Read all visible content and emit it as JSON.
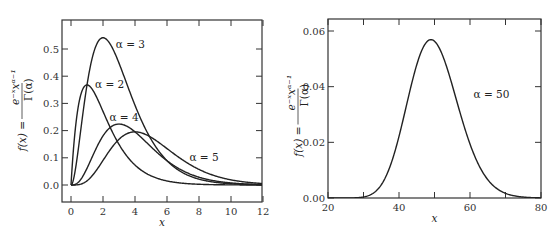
{
  "chart_data": [
    {
      "type": "line",
      "title": "",
      "xlabel": "x",
      "ylabel": "f(x) = e^{-x} x^{α-1} / Γ(α)",
      "ylabel_parts": {
        "lhs": "f(x) =",
        "num": "e^{-x} x^{α-1}",
        "den": "Γ(α)"
      },
      "xlim": [
        -0.5,
        12
      ],
      "ylim": [
        -0.06,
        0.6
      ],
      "xticks": [
        0,
        2,
        4,
        6,
        8,
        10,
        12
      ],
      "xtick_labels": [
        "0",
        "2",
        "4",
        "6",
        "8",
        "10",
        "12"
      ],
      "yticks": [
        0.0,
        0.1,
        0.2,
        0.3,
        0.4,
        0.5
      ],
      "ytick_labels": [
        "0.0",
        "0.1",
        "0.2",
        "0.3",
        "0.4",
        "0.5"
      ],
      "grid": false,
      "legend": "inline annotations",
      "series": [
        {
          "name": "α = 2",
          "alpha": 2,
          "scale": 1.0,
          "peak": {
            "x": 1,
            "y": 0.368
          },
          "label_pos": [
            1.5,
            0.37
          ]
        },
        {
          "name": "α = 3",
          "alpha": 3,
          "scale": 2.0,
          "peak": {
            "x": 2,
            "y": 0.541
          },
          "label_pos": [
            2.8,
            0.52
          ]
        },
        {
          "name": "α = 4",
          "alpha": 4,
          "scale": 1.0,
          "peak": {
            "x": 3,
            "y": 0.224
          },
          "label_pos": [
            2.4,
            0.25
          ]
        },
        {
          "name": "α = 5",
          "alpha": 5,
          "scale": 1.0,
          "peak": {
            "x": 4,
            "y": 0.195
          },
          "label_pos": [
            7.4,
            0.103
          ]
        }
      ]
    },
    {
      "type": "line",
      "title": "",
      "xlabel": "x",
      "ylabel": "f(x) = e^{-x} x^{α-1} / Γ(α)",
      "ylabel_parts": {
        "lhs": "f(x) =",
        "num": "e^{-x} x^{α-1}",
        "den": "Γ(α)"
      },
      "xlim": [
        20,
        80
      ],
      "ylim": [
        0.0,
        0.065
      ],
      "xticks": [
        20,
        30,
        40,
        50,
        60,
        70,
        80
      ],
      "xtick_labels": [
        "20",
        "",
        "40",
        "",
        "60",
        "",
        "80"
      ],
      "yticks": [
        0.0,
        0.02,
        0.04,
        0.06
      ],
      "ytick_labels": [
        "0.00",
        "0.02",
        "0.04",
        "0.06"
      ],
      "grid": false,
      "legend": "inline annotations",
      "series": [
        {
          "name": "α = 50",
          "alpha": 50,
          "scale": 1.0,
          "peak": {
            "x": 49,
            "y": 0.0569
          },
          "label_pos": [
            61,
            0.0375
          ]
        }
      ]
    }
  ]
}
